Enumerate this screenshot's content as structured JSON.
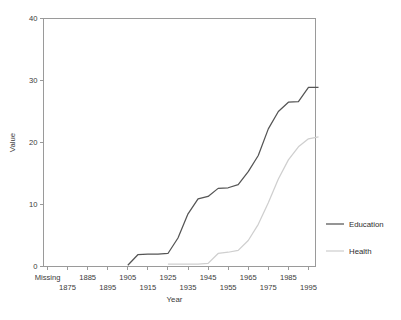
{
  "figure": {
    "background": "#ffffff",
    "caption": ""
  },
  "chart_data": {
    "type": "line",
    "title": "",
    "xlabel": "Year",
    "ylabel": "Value",
    "grid": false,
    "legend_position": "right",
    "ylim": [
      0,
      40
    ],
    "yticks": [
      0,
      10,
      20,
      30,
      40
    ],
    "categories": [
      "Missing",
      "1875",
      "1885",
      "1895",
      "1905",
      "1915",
      "1925",
      "1935",
      "1945",
      "1955",
      "1965",
      "1975",
      "1985",
      "1995"
    ],
    "xtick_labels_top": [
      "Missing",
      "",
      "1885",
      "",
      "1905",
      "",
      "1925",
      "",
      "1945",
      "",
      "1965",
      "",
      "1985",
      ""
    ],
    "xtick_labels_bottom": [
      "",
      "1875",
      "",
      "1895",
      "",
      "1915",
      "",
      "1935",
      "",
      "1955",
      "",
      "1975",
      "",
      "1995"
    ],
    "series": [
      {
        "name": "Education",
        "color": "#555555",
        "x": [
          "1905",
          "1910",
          "1915",
          "1920",
          "1925",
          "1930",
          "1935",
          "1940",
          "1945",
          "1950",
          "1955",
          "1960",
          "1965",
          "1970",
          "1975",
          "1980",
          "1985",
          "1990",
          "1995",
          "2000"
        ],
        "values": [
          0.2,
          1.9,
          2.0,
          2.0,
          2.1,
          4.6,
          8.5,
          10.9,
          11.3,
          12.6,
          12.7,
          13.2,
          15.3,
          17.9,
          22.2,
          25.0,
          26.5,
          26.6,
          28.9,
          28.9
        ]
      },
      {
        "name": "Health",
        "color": "#cfcfcf",
        "x": [
          "1925",
          "1930",
          "1935",
          "1940",
          "1945",
          "1950",
          "1955",
          "1960",
          "1965",
          "1970",
          "1975",
          "1980",
          "1985",
          "1990",
          "1995",
          "2000"
        ],
        "values": [
          0.4,
          0.4,
          0.4,
          0.4,
          0.5,
          2.1,
          2.3,
          2.6,
          4.2,
          6.8,
          10.3,
          14.1,
          17.2,
          19.3,
          20.6,
          20.9
        ]
      }
    ]
  },
  "legend": {
    "items": [
      {
        "label": "Education",
        "color": "#555555"
      },
      {
        "label": "Health",
        "color": "#cfcfcf"
      }
    ]
  }
}
